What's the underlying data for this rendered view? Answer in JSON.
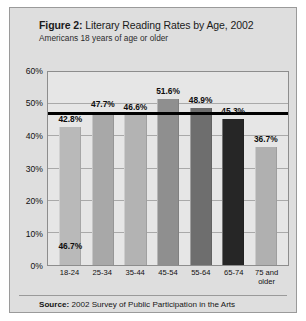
{
  "figure": {
    "label": "Figure 2:",
    "title": "Literary Reading Rates by Age, 2002",
    "subtitle": "Americans 18 years of age or older",
    "source_label": "Source:",
    "source_text": "2002 Survey of Public Participation in the Arts"
  },
  "chart_data": {
    "type": "bar",
    "title": "Literary Reading Rates by Age, 2002",
    "subtitle": "Americans 18 years of age or older",
    "xlabel": "",
    "ylabel": "",
    "ylim": [
      0,
      60
    ],
    "grid": true,
    "legend": "none",
    "categories": [
      "18-24",
      "25-34",
      "35-44",
      "45-54",
      "55-64",
      "65-74",
      "75 and\nolder"
    ],
    "values": [
      42.8,
      47.7,
      46.6,
      51.6,
      48.9,
      45.3,
      36.7
    ],
    "value_labels": [
      "42.8%",
      "47.7%",
      "46.6%",
      "51.6%",
      "48.9%",
      "45.3%",
      "36.7%"
    ],
    "bar_colors": [
      "#b9b9b9",
      "#a8a8a8",
      "#b3b3b3",
      "#8f8f8f",
      "#6e6e6e",
      "#262626",
      "#b0b0b0"
    ],
    "ytick_labels": [
      "0%",
      "10%",
      "20%",
      "30%",
      "40%",
      "50%",
      "60%"
    ],
    "ytick_values": [
      0,
      10,
      20,
      30,
      40,
      50,
      60
    ],
    "reference_line": {
      "value": 46.7,
      "label": "46.7%",
      "color": "#000000"
    }
  }
}
